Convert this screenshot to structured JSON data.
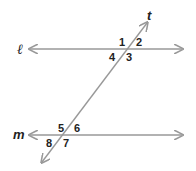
{
  "diagram": {
    "line_color": "#999999",
    "text_color": "#222222",
    "lines": {
      "l": {
        "label": "ℓ"
      },
      "m": {
        "label": "m"
      },
      "t": {
        "label": "t"
      }
    },
    "angles_top": [
      "1",
      "2",
      "3",
      "4"
    ],
    "angles_bottom": [
      "5",
      "6",
      "7",
      "8"
    ]
  }
}
